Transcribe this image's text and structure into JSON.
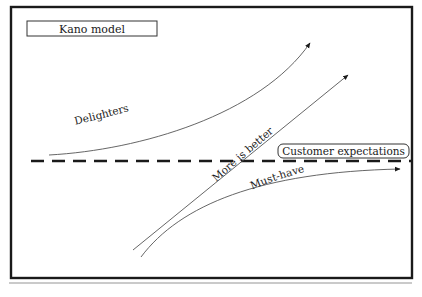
{
  "diagram": {
    "title": "Kano model",
    "curves": [
      {
        "name": "Delighters",
        "label": "Delighters",
        "shape": "convex-up exponential"
      },
      {
        "name": "More is better",
        "label": "More is better",
        "shape": "linear"
      },
      {
        "name": "Must-have",
        "label": "Must-have",
        "shape": "concave saturating"
      }
    ],
    "reference_line": {
      "label": "Customer expectations",
      "style": "dashed"
    }
  },
  "colors": {
    "frame": "#1a1a1a",
    "curve": "#555555",
    "dashed_line": "#1a1a1a",
    "rule": "#b8b8b8",
    "background": "#ffffff"
  }
}
